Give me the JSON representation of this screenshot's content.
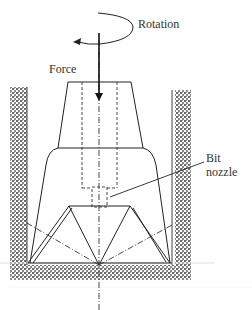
{
  "figure": {
    "type": "drill-bit-schematic",
    "labels": {
      "rotation": "Rotation",
      "force": "Force",
      "bit_line1": "Bit",
      "bit_line2": "nozzle"
    },
    "colors": {
      "stroke": "#222222",
      "hatch": "#555555",
      "background": "#ffffff"
    }
  }
}
